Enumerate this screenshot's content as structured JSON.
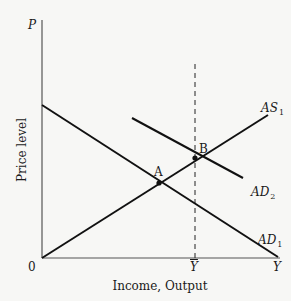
{
  "diagram": {
    "type": "AD-AS model",
    "axes": {
      "y_axis_symbol": "P",
      "y_axis_label": "Price level",
      "x_axis_label": "Income, Output",
      "origin_label": "0",
      "x_axis_end_symbol": "Y",
      "x_tick_label": "Y",
      "x_tick_note": "Y-bar (full-employment output)"
    },
    "curves": [
      {
        "id": "AD1",
        "label_main": "AD",
        "label_sub": "1",
        "slope": "downward"
      },
      {
        "id": "AD2",
        "label_main": "AD",
        "label_sub": "2",
        "slope": "downward"
      },
      {
        "id": "AS1",
        "label_main": "AS",
        "label_sub": "1",
        "slope": "upward"
      }
    ],
    "points": [
      {
        "label": "A",
        "at": "AD1 ∩ AS1"
      },
      {
        "label": "B",
        "at": "AD2 ∩ AS1 at Y-bar"
      }
    ],
    "reference_line": {
      "type": "dashed vertical",
      "at": "Y-bar"
    },
    "colors": {
      "line": "#111111",
      "axis": "#555555",
      "background": "#f7f7f5"
    }
  }
}
